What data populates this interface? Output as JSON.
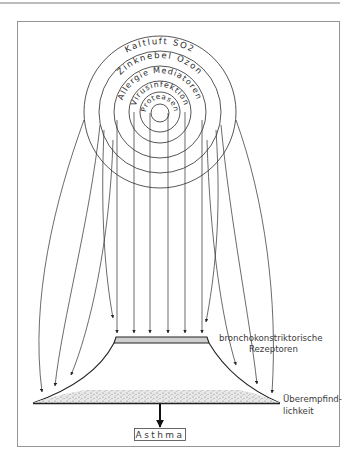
{
  "diagram": {
    "rings": [
      {
        "label": "Kaltluft SO2",
        "radius": 76
      },
      {
        "label": "Zinknebel Ozon",
        "radius": 60
      },
      {
        "label": "Allergie Mediatoren",
        "radius": 43
      },
      {
        "label": "Virusinfektion",
        "radius": 27
      },
      {
        "label": "Proteasen",
        "radius": 24
      }
    ],
    "inner_circle_radius": 9,
    "receptor_label_line1": "bronchokonstriktorische",
    "receptor_label_line2": "Rezeptoren",
    "hypersensitivity_label_line1": "Überempfind-",
    "hypersensitivity_label_line2": "lichkeit",
    "outcome_label": "Asthma",
    "colors": {
      "line": "#2b2b2b",
      "receptor_bar": "#cfcfcf",
      "stipple": "#b8b8b8",
      "frame": "#8a8a8a"
    }
  }
}
